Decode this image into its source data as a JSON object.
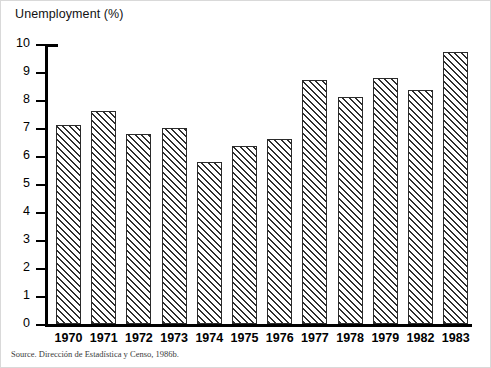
{
  "chart_data": {
    "type": "bar",
    "title": "Unemployment (%)",
    "xlabel": "",
    "ylabel": "Unemployment (%)",
    "ylim": [
      0,
      10
    ],
    "ytick_step": 1,
    "grid": false,
    "legend": null,
    "categories": [
      "1970",
      "1971",
      "1972",
      "1973",
      "1974",
      "1975",
      "1976",
      "1977",
      "1978",
      "1979",
      "1982",
      "1983"
    ],
    "values": [
      7.1,
      7.6,
      6.8,
      7.0,
      5.8,
      6.35,
      6.6,
      8.7,
      8.1,
      8.8,
      8.35,
      9.7
    ],
    "ytick_labels": [
      "10",
      "9",
      "8",
      "7",
      "6",
      "5",
      "4",
      "3",
      "2",
      "1",
      "0"
    ],
    "bar_fill": "diagonal-hatch",
    "bar_edge_color": "#2b2b2b",
    "bar_face_color": "#ffffff",
    "axis_color": "#000000"
  },
  "source_note": "Source. Dirección de Estadística y Censo, 1986b."
}
